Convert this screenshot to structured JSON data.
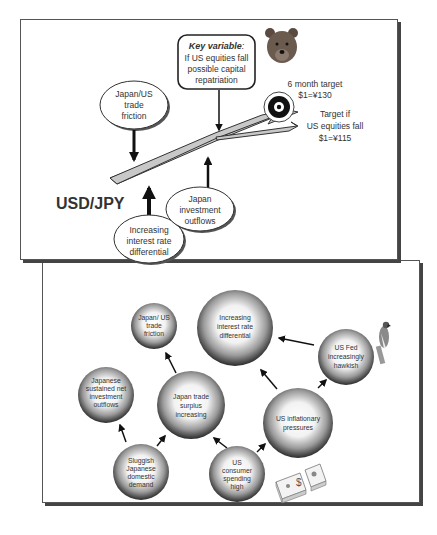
{
  "top_panel": {
    "pair_label": "USD/JPY",
    "key_variable": {
      "title": "Key variable",
      "title_suffix": ":",
      "lines": [
        "If US equities fall",
        "possible capital",
        "repatriation"
      ]
    },
    "target_main": {
      "lines": [
        "6 month target",
        "$1=¥130"
      ]
    },
    "target_alt": {
      "lines": [
        "Target if",
        "US equities fall",
        "$1=¥115"
      ]
    },
    "factors": [
      {
        "id": "trade-friction",
        "lines": [
          "Japan/US",
          "trade",
          "friction"
        ]
      },
      {
        "id": "investment-outflows",
        "lines": [
          "Japan",
          "investment",
          "outflows"
        ]
      },
      {
        "id": "rate-differential",
        "lines": [
          "Increasing",
          "interest rate",
          "differential"
        ]
      }
    ],
    "icons": {
      "bear": "bear-icon",
      "target": "bullseye-icon"
    }
  },
  "bottom_panel": {
    "nodes": [
      {
        "id": "trade-friction",
        "lines": [
          "Japan/ US",
          "trade",
          "friction"
        ]
      },
      {
        "id": "rate-differential",
        "lines": [
          "Increasing",
          "interest rate",
          "differential"
        ]
      },
      {
        "id": "fed-hawkish",
        "lines": [
          "US Fed",
          "increasingly",
          "hawkish"
        ]
      },
      {
        "id": "net-outflows",
        "lines": [
          "Japanese",
          "sustained net",
          "investment",
          "outflows"
        ]
      },
      {
        "id": "trade-surplus",
        "lines": [
          "Japan trade",
          "surplus",
          "increasing"
        ]
      },
      {
        "id": "inflation",
        "lines": [
          "US inflationary",
          "pressures"
        ]
      },
      {
        "id": "domestic-demand",
        "lines": [
          "Sluggish",
          "Japanese",
          "domestic",
          "demand"
        ]
      },
      {
        "id": "consumer-spending",
        "lines": [
          "US",
          "consumer",
          "spending",
          "high"
        ]
      }
    ],
    "icons": {
      "hawk": "hawk-icon",
      "money": "money-stack-icon"
    }
  }
}
